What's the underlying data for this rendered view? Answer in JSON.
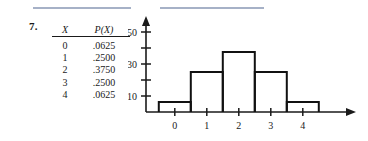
{
  "problem": {
    "number": "7."
  },
  "rules": [
    {
      "name": "top-rule-left"
    },
    {
      "name": "top-rule-right"
    }
  ],
  "table": {
    "headers": [
      "X",
      "P(X)"
    ],
    "rows": [
      {
        "x": "0",
        "p": ".0625"
      },
      {
        "x": "1",
        "p": ".2500"
      },
      {
        "x": "2",
        "p": ".3750"
      },
      {
        "x": "3",
        "p": ".2500"
      },
      {
        "x": "4",
        "p": ".0625"
      }
    ]
  },
  "chart_data": {
    "type": "bar",
    "title": "",
    "subtitle": "",
    "xlabel": "",
    "ylabel": "",
    "categories": [
      "0",
      "1",
      "2",
      "3",
      "4"
    ],
    "values": [
      0.0625,
      0.25,
      0.375,
      0.25,
      0.0625
    ],
    "series": [
      {
        "name": "P(X)",
        "values": [
          0.0625,
          0.25,
          0.375,
          0.25,
          0.0625
        ]
      }
    ],
    "x": [
      0,
      1,
      2,
      3,
      4
    ],
    "xlim": [
      -0.9,
      5.2
    ],
    "ylim": [
      0,
      0.56
    ],
    "grid": false,
    "legend": false,
    "bar_width": 1,
    "bar_style": "outline",
    "axis_style": "arrow",
    "xtick_labels": [
      "0",
      "1",
      "2",
      "3",
      "4"
    ],
    "xtick_values": [
      0,
      1,
      2,
      3,
      4
    ],
    "ytick_values": [
      0.1,
      0.2,
      0.3,
      0.4,
      0.5
    ],
    "ytick_labels_shown": [
      {
        "value": 0.5,
        "label": ".50"
      },
      {
        "value": 0.3,
        "label": ".30"
      },
      {
        "value": 0.1,
        "label": ".10"
      }
    ],
    "ytick_labels_hidden": [
      0.2,
      0.4
    ],
    "annotations": []
  },
  "colors": {
    "rule": "#97a3bd",
    "ink": "#1a1a1a",
    "bar_stroke": "#111111"
  }
}
